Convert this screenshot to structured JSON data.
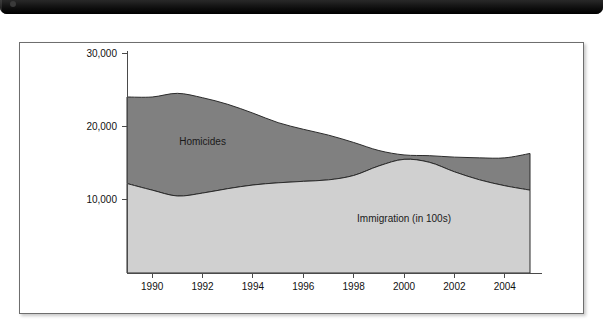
{
  "header": {
    "strip_present": true,
    "strip_color": "#141414",
    "label": ""
  },
  "figure": {
    "border_color": "#6e6e6e",
    "background": "#ffffff"
  },
  "chart_data": {
    "type": "area",
    "stacked": true,
    "title": "",
    "subtitle": "",
    "xlabel": "",
    "ylabel": "",
    "grid": false,
    "legend_position": "inline-annotation",
    "x": [
      1989,
      1990,
      1991,
      1992,
      1993,
      1994,
      1995,
      1996,
      1997,
      1998,
      1999,
      2000,
      2001,
      2002,
      2003,
      2004,
      2005
    ],
    "xlim": [
      1989,
      2005
    ],
    "ylim": [
      0,
      30000
    ],
    "x_tick_labels": [
      "1990",
      "1992",
      "1994",
      "1996",
      "1998",
      "2000",
      "2002",
      "2004"
    ],
    "x_ticks": [
      1990,
      1992,
      1994,
      1996,
      1998,
      2000,
      2002,
      2004
    ],
    "y_tick_labels": [
      "10,000",
      "20,000",
      "30,000"
    ],
    "y_ticks": [
      10000,
      20000,
      30000
    ],
    "series": [
      {
        "name": "Immigration (in 100s)",
        "color": "#d0d0d0",
        "label_x": 2000,
        "label_y": 7000,
        "values": [
          12200,
          11300,
          10500,
          10900,
          11500,
          12000,
          12300,
          12500,
          12700,
          13300,
          14600,
          15500,
          15100,
          13800,
          12700,
          11900,
          11300
        ]
      },
      {
        "name": "Homicides",
        "color": "#808080",
        "label_x": 1992,
        "label_y": 17500,
        "values": [
          11800,
          12700,
          14000,
          13000,
          11500,
          9800,
          8200,
          7100,
          6100,
          4500,
          2100,
          600,
          900,
          2000,
          3000,
          3800,
          5000
        ]
      }
    ],
    "totals": [
      24000,
      24000,
      24500,
      23900,
      23000,
      21800,
      20500,
      19600,
      18800,
      17800,
      16700,
      16100,
      16000,
      15800,
      15700,
      15700,
      16300
    ]
  }
}
